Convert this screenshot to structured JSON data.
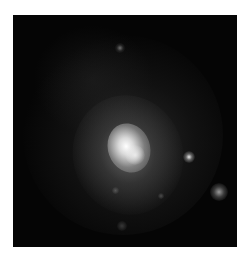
{
  "image": {
    "subject": "galaxy",
    "description": "Grayscale astronomical image of a galaxy with a bright elongated core, diffuse halo and several surrounding point sources",
    "background_color": "#ffffff",
    "frame_color": "#050505",
    "features": [
      {
        "name": "galaxy-core",
        "approx_center": [
          128,
          140
        ]
      },
      {
        "name": "point-source",
        "approx_center": [
          188,
          157
        ]
      },
      {
        "name": "point-source",
        "approx_center": [
          218,
          191
        ]
      },
      {
        "name": "point-source",
        "approx_center": [
          120,
          48
        ]
      }
    ]
  }
}
